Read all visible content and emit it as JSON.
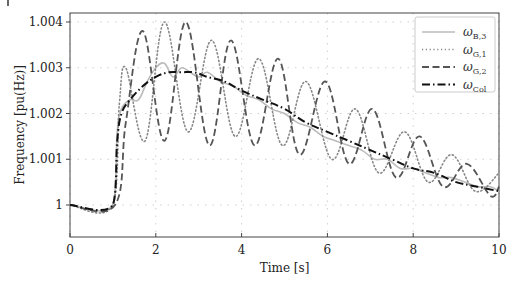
{
  "chart_data": {
    "type": "line",
    "title": "",
    "xlabel": "Time [s]",
    "ylabel": "Frequency [pu(Hz)]",
    "xlim": [
      0,
      10
    ],
    "ylim": [
      0.99965,
      1.00423
    ],
    "xticks": [
      0,
      2,
      4,
      6,
      8,
      10
    ],
    "xtick_labels": [
      "0",
      "2",
      "4",
      "6",
      "8",
      "10"
    ],
    "yticks": [
      1.0,
      1.001,
      1.002,
      1.003,
      1.004
    ],
    "ytick_labels": [
      "1",
      "1.001",
      "1.002",
      "1.003",
      "1.004"
    ],
    "grid": true,
    "legend_position": "upper right",
    "series": [
      {
        "name": "ω_B,3",
        "label_main": "ω",
        "label_sub": "B,3",
        "style": "solid",
        "color": "#bbbbbb",
        "x": [
          0,
          1.0,
          1.1,
          1.2,
          1.4,
          1.6,
          1.8,
          2.0,
          2.2,
          2.4,
          2.6,
          2.8,
          3.0,
          3.2,
          3.5,
          3.8,
          4.1,
          4.4,
          4.7,
          5.0,
          5.3,
          5.6,
          5.9,
          6.2,
          6.5,
          6.8,
          7.1,
          7.4,
          7.7,
          8.0,
          8.3,
          8.6,
          8.9,
          9.2,
          9.5,
          9.8,
          10
        ],
        "y": [
          1.0,
          1.0,
          1.0016,
          1.0021,
          1.0023,
          1.0023,
          1.0027,
          1.003,
          1.0031,
          1.0028,
          1.003,
          1.0029,
          1.0028,
          1.0029,
          1.0027,
          1.0026,
          1.0024,
          1.0023,
          1.0021,
          1.002,
          1.0018,
          1.0017,
          1.0015,
          1.0014,
          1.0013,
          1.0012,
          1.001,
          1.001,
          1.0008,
          1.0008,
          1.0007,
          1.0006,
          1.0006,
          1.0005,
          1.0004,
          1.0004,
          1.0003
        ]
      },
      {
        "name": "ω_G,1",
        "label_main": "ω",
        "label_sub": "G,1",
        "style": "dotted",
        "color": "#888888",
        "x": [
          0,
          1.0,
          1.15,
          1.3,
          1.75,
          2.2,
          2.75,
          3.3,
          3.85,
          4.4,
          4.95,
          5.5,
          6.1,
          6.65,
          7.2,
          7.8,
          8.35,
          8.9,
          9.45,
          10
        ],
        "y": [
          1.0,
          1.0,
          1.0022,
          1.003,
          1.0014,
          1.004,
          1.0016,
          1.0036,
          1.0015,
          1.0032,
          1.0013,
          1.0027,
          1.001,
          1.0021,
          1.0007,
          1.0016,
          1.0005,
          1.0011,
          1.0003,
          1.0007
        ]
      },
      {
        "name": "ω_G,2",
        "label_main": "ω",
        "label_sub": "G,2",
        "style": "dashed",
        "color": "#555555",
        "x": [
          0,
          1.05,
          1.3,
          1.7,
          2.2,
          2.7,
          3.25,
          3.75,
          4.3,
          4.85,
          5.35,
          5.95,
          6.5,
          7.05,
          7.6,
          8.15,
          8.7,
          9.25,
          9.8,
          10
        ],
        "y": [
          1.0,
          1.0,
          1.0018,
          1.0038,
          1.0014,
          1.004,
          1.0013,
          1.0036,
          1.0013,
          1.0032,
          1.0011,
          1.0027,
          1.0009,
          1.0021,
          1.0006,
          1.0015,
          1.0004,
          1.0009,
          1.0002,
          1.0004
        ]
      },
      {
        "name": "ω_Col",
        "label_main": "ω",
        "label_sub": "Col",
        "style": "dashdot",
        "color": "#111111",
        "x": [
          0,
          1.0,
          1.1,
          1.2,
          1.4,
          1.7,
          2.0,
          2.3,
          2.6,
          2.9,
          3.2,
          3.6,
          4.0,
          4.5,
          5.0,
          5.5,
          6.0,
          6.5,
          7.0,
          7.5,
          8.0,
          8.5,
          9.0,
          9.5,
          10
        ],
        "y": [
          1.0,
          1.0,
          1.0014,
          1.002,
          1.0023,
          1.0026,
          1.0028,
          1.0029,
          1.0029,
          1.0029,
          1.0028,
          1.0027,
          1.0025,
          1.0023,
          1.0021,
          1.0018,
          1.0016,
          1.0014,
          1.0012,
          1.001,
          1.0008,
          1.0007,
          1.0005,
          1.0004,
          1.0003
        ]
      }
    ]
  }
}
